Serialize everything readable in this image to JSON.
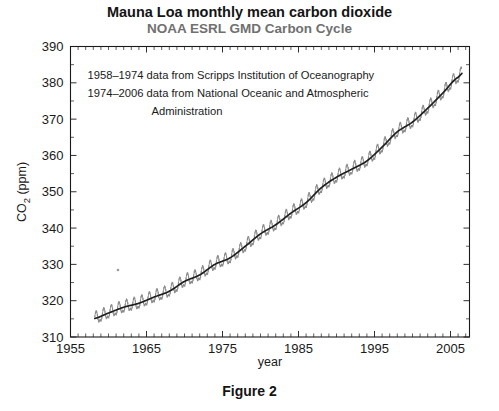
{
  "figure": {
    "caption": "Figure 2"
  },
  "chart_data": {
    "type": "line",
    "title": "Mauna Loa monthly mean carbon dioxide",
    "subtitle": "NOAA ESRL GMD Carbon Cycle",
    "xlabel": "year",
    "ylabel": "CO2 (ppm)",
    "ylabel_parts": {
      "prefix": "CO",
      "sub": "2",
      "suffix": " (ppm)"
    },
    "xlim": [
      1955,
      2007.5
    ],
    "ylim": [
      310,
      390
    ],
    "xticks": [
      1955,
      1965,
      1975,
      1985,
      1995,
      2005
    ],
    "xtick_labels": [
      "1955",
      "1965",
      "1975",
      "1985",
      "1995",
      "2005"
    ],
    "x_minor_step": 1,
    "yticks": [
      310,
      320,
      330,
      340,
      350,
      360,
      370,
      380,
      390
    ],
    "ytick_labels": [
      "310",
      "320",
      "330",
      "340",
      "350",
      "360",
      "370",
      "380",
      "390"
    ],
    "y_minor_step": 5,
    "grid": false,
    "legend": "none",
    "annotations": [
      "1958–1974 data from Scripps Institution of Oceanography",
      "1974–2006 data from National Oceanic and Atmospheric",
      "Administration"
    ],
    "colors": {
      "monthly": "#8a8a8a",
      "trend": "#1f1f1f",
      "axis": "#1a1a1a",
      "title": "#141414",
      "subtitle": "#707070",
      "background": "#ffffff"
    },
    "series": [
      {
        "name": "monthly mean",
        "style": "seasonal-oscillation",
        "seasonal_amplitude_ppm": 3.1,
        "seasonal_peak_month": 5,
        "x_start": 1958.2,
        "x_end": 2006.5,
        "samples_per_year": 12
      },
      {
        "name": "annual trend (seasonally corrected)",
        "style": "smooth",
        "x": [
          1958,
          1960,
          1962,
          1964,
          1966,
          1968,
          1970,
          1972,
          1974,
          1976,
          1978,
          1980,
          1982,
          1984,
          1986,
          1988,
          1990,
          1992,
          1994,
          1996,
          1998,
          2000,
          2002,
          2004,
          2006
        ],
        "values": [
          315.0,
          316.6,
          318.2,
          319.3,
          321.0,
          322.6,
          325.3,
          327.1,
          330.0,
          331.8,
          335.0,
          338.4,
          340.9,
          344.1,
          347.0,
          351.1,
          354.0,
          356.2,
          358.5,
          362.3,
          366.5,
          369.2,
          373.0,
          377.2,
          381.5
        ]
      }
    ]
  }
}
